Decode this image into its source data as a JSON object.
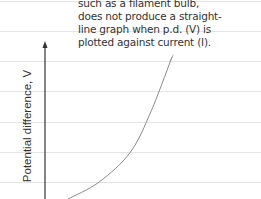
{
  "annotation": {
    "lines": [
      "such as a filament bulb,",
      "does not produce a straight-",
      "line graph when p.d. (V) is",
      "plotted against current (I)."
    ]
  },
  "axes": {
    "ylabel": "Potential difference, V"
  },
  "chart_data": {
    "type": "line",
    "title": "",
    "ylabel": "Potential difference, V",
    "xlabel": "",
    "series": [
      {
        "name": "filament-bulb",
        "x": [
          0.0,
          0.3,
          0.6,
          0.8,
          1.0
        ],
        "y": [
          0.0,
          0.12,
          0.33,
          0.62,
          1.0
        ]
      }
    ]
  }
}
